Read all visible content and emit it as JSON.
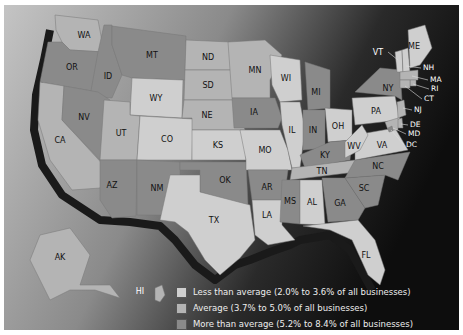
{
  "map": {
    "title": "",
    "palette": {
      "less": "#cfcfcf",
      "average": "#b4b4b4",
      "more": "#8a8a8a",
      "shadow": "#1a1a1a",
      "background_light": "#bdbdbd",
      "background_dark": "#151515"
    },
    "states": [
      {
        "abbr": "WA",
        "category": "average"
      },
      {
        "abbr": "OR",
        "category": "more"
      },
      {
        "abbr": "CA",
        "category": "average"
      },
      {
        "abbr": "ID",
        "category": "more"
      },
      {
        "abbr": "NV",
        "category": "more"
      },
      {
        "abbr": "MT",
        "category": "more"
      },
      {
        "abbr": "WY",
        "category": "less"
      },
      {
        "abbr": "UT",
        "category": "average"
      },
      {
        "abbr": "CO",
        "category": "less"
      },
      {
        "abbr": "AZ",
        "category": "more"
      },
      {
        "abbr": "NM",
        "category": "more"
      },
      {
        "abbr": "ND",
        "category": "average"
      },
      {
        "abbr": "SD",
        "category": "average"
      },
      {
        "abbr": "NE",
        "category": "average"
      },
      {
        "abbr": "KS",
        "category": "less"
      },
      {
        "abbr": "OK",
        "category": "more"
      },
      {
        "abbr": "TX",
        "category": "less"
      },
      {
        "abbr": "MN",
        "category": "average"
      },
      {
        "abbr": "IA",
        "category": "more"
      },
      {
        "abbr": "MO",
        "category": "less"
      },
      {
        "abbr": "AR",
        "category": "more"
      },
      {
        "abbr": "LA",
        "category": "less"
      },
      {
        "abbr": "WI",
        "category": "less"
      },
      {
        "abbr": "IL",
        "category": "less"
      },
      {
        "abbr": "MI",
        "category": "more"
      },
      {
        "abbr": "IN",
        "category": "more"
      },
      {
        "abbr": "OH",
        "category": "less"
      },
      {
        "abbr": "KY",
        "category": "more"
      },
      {
        "abbr": "TN",
        "category": "average"
      },
      {
        "abbr": "MS",
        "category": "more"
      },
      {
        "abbr": "AL",
        "category": "less"
      },
      {
        "abbr": "GA",
        "category": "more"
      },
      {
        "abbr": "FL",
        "category": "less"
      },
      {
        "abbr": "SC",
        "category": "more"
      },
      {
        "abbr": "NC",
        "category": "more"
      },
      {
        "abbr": "VA",
        "category": "less"
      },
      {
        "abbr": "WV",
        "category": "less"
      },
      {
        "abbr": "PA",
        "category": "less"
      },
      {
        "abbr": "NY",
        "category": "more"
      },
      {
        "abbr": "NJ",
        "category": "average"
      },
      {
        "abbr": "DE",
        "category": "average"
      },
      {
        "abbr": "MD",
        "category": "average"
      },
      {
        "abbr": "DC",
        "category": "more"
      },
      {
        "abbr": "VT",
        "category": "less"
      },
      {
        "abbr": "NH",
        "category": "less"
      },
      {
        "abbr": "ME",
        "category": "less"
      },
      {
        "abbr": "MA",
        "category": "average"
      },
      {
        "abbr": "RI",
        "category": "average"
      },
      {
        "abbr": "CT",
        "category": "average"
      },
      {
        "abbr": "AK",
        "category": "average"
      },
      {
        "abbr": "HI",
        "category": "average"
      }
    ]
  },
  "legend": {
    "items": [
      {
        "key": "less",
        "label": "Less than average (2.0% to 3.6% of all businesses)"
      },
      {
        "key": "average",
        "label": "Average (3.7% to 5.0% of all businesses)"
      },
      {
        "key": "more",
        "label": "More than average (5.2% to 8.4% of all businesses)"
      }
    ]
  }
}
